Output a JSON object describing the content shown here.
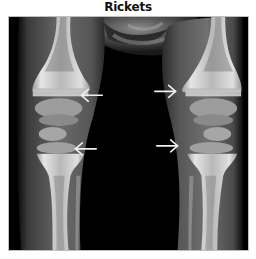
{
  "figure": {
    "title": "Rickets",
    "image_description": "Frontal radiograph of a child's knees showing widened, frayed metaphyses",
    "annotations": [
      {
        "type": "arrow",
        "direction": "left",
        "label": "upper-left-arrow"
      },
      {
        "type": "arrow",
        "direction": "right",
        "label": "upper-right-arrow"
      },
      {
        "type": "arrow",
        "direction": "left",
        "label": "lower-left-arrow"
      },
      {
        "type": "arrow",
        "direction": "right",
        "label": "lower-right-arrow"
      }
    ],
    "colors": {
      "background": "#ffffff",
      "xray_dark": "#000000",
      "bone": "#d8d8d8",
      "arrow": "#f2f2f2"
    }
  }
}
